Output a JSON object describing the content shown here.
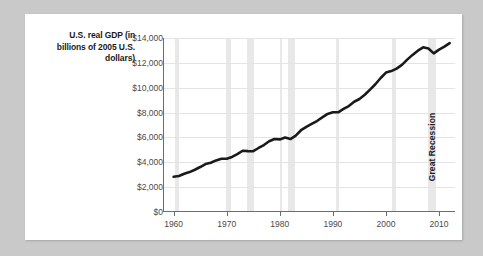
{
  "figure": {
    "background_color": "#c9c9c9",
    "card_color": "#ffffff",
    "axis_title": "U.S. real GDP (in billions of 2005 U.S. dollars)",
    "line_color": "#1a1a1a",
    "band_color": "#e8e8e8",
    "grid_color": "#e4e4e4",
    "axis_color": "#6d6d6d"
  },
  "chart_data": {
    "type": "line",
    "title": "",
    "xlabel": "",
    "ylabel": "U.S. real GDP (in billions of 2005 U.S. dollars)",
    "xlim": [
      1958,
      2013
    ],
    "ylim": [
      0,
      14000
    ],
    "grid": true,
    "legend": "none",
    "ytick_labels": [
      "$14,000",
      "$12,000",
      "$10,000",
      "$8,000",
      "$6,000",
      "$4,000",
      "$2,000",
      "$0"
    ],
    "ytick_values": [
      14000,
      12000,
      10000,
      8000,
      6000,
      4000,
      2000,
      0
    ],
    "xtick_labels": [
      "1960",
      "1970",
      "1980",
      "1990",
      "2000",
      "2010"
    ],
    "xtick_values": [
      1960,
      1970,
      1980,
      1990,
      2000,
      2010
    ],
    "series": [
      {
        "name": "U.S. real GDP",
        "x": [
          1960,
          1961,
          1962,
          1963,
          1964,
          1965,
          1966,
          1967,
          1968,
          1969,
          1970,
          1971,
          1972,
          1973,
          1974,
          1975,
          1976,
          1977,
          1978,
          1979,
          1980,
          1981,
          1982,
          1983,
          1984,
          1985,
          1986,
          1987,
          1988,
          1989,
          1990,
          1991,
          1992,
          1993,
          1994,
          1995,
          1996,
          1997,
          1998,
          1999,
          2000,
          2001,
          2002,
          2003,
          2004,
          2005,
          2006,
          2007,
          2008,
          2009,
          2010,
          2011,
          2012
        ],
        "values": [
          2830,
          2900,
          3080,
          3210,
          3400,
          3620,
          3860,
          3960,
          4150,
          4280,
          4290,
          4430,
          4660,
          4930,
          4900,
          4890,
          5150,
          5390,
          5690,
          5870,
          5840,
          5990,
          5870,
          6140,
          6580,
          6850,
          7090,
          7320,
          7610,
          7890,
          8030,
          8020,
          8290,
          8520,
          8870,
          9090,
          9430,
          9850,
          10280,
          10780,
          11220,
          11340,
          11540,
          11840,
          12260,
          12640,
          12980,
          13250,
          13160,
          12760,
          13060,
          13300,
          13590
        ],
        "units": "billions of 2005 U.S. dollars"
      }
    ],
    "recession_bands": [
      {
        "start": 1960.2,
        "end": 1961.1,
        "label": ""
      },
      {
        "start": 1969.9,
        "end": 1970.9,
        "label": ""
      },
      {
        "start": 1973.9,
        "end": 1975.2,
        "label": ""
      },
      {
        "start": 1980.0,
        "end": 1980.5,
        "label": ""
      },
      {
        "start": 1981.5,
        "end": 1982.9,
        "label": ""
      },
      {
        "start": 1990.5,
        "end": 1991.2,
        "label": ""
      },
      {
        "start": 2001.2,
        "end": 2001.9,
        "label": ""
      },
      {
        "start": 2007.9,
        "end": 2009.4,
        "label": "Great Recession"
      }
    ],
    "annotations": [
      {
        "text": "Great Recession",
        "x": 2008.6,
        "orientation": "vertical"
      }
    ]
  }
}
